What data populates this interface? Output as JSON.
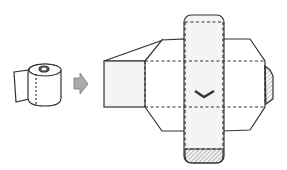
{
  "figure": {
    "type": "fold-diagram",
    "steps": [
      "toilet-paper-roll",
      "arrow",
      "unfolded-box-net"
    ],
    "colors": {
      "line": "#333333",
      "arrow": "#aaaaaa",
      "paper": "#f4f4f4",
      "hatch": "#555555"
    }
  }
}
